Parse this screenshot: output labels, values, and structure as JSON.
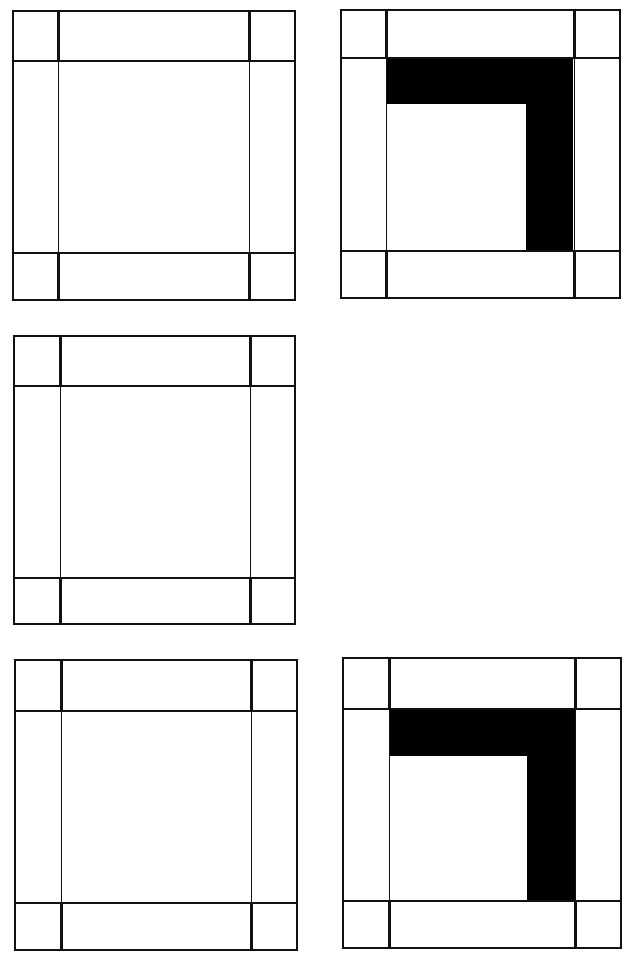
{
  "figure": {
    "colors": {
      "line": "#111111",
      "fill": "#000000",
      "background": "#ffffff"
    },
    "blocks": [
      {
        "id": "top-left",
        "x": 12,
        "y": 10,
        "w": 284,
        "h": 291,
        "v": [
          58,
          249
        ],
        "h_lines": [
          60,
          252
        ],
        "l_shape": false
      },
      {
        "id": "top-right",
        "x": 340,
        "y": 9,
        "w": 281,
        "h": 290,
        "v": [
          386,
          574
        ],
        "h_lines": [
          57,
          250
        ],
        "l_shape": true,
        "l_top": [
          387,
          58,
          573,
          104
        ],
        "l_right": [
          526,
          58,
          573,
          250
        ]
      },
      {
        "id": "middle-left",
        "x": 13,
        "y": 335,
        "w": 283,
        "h": 290,
        "v": [
          60,
          250
        ],
        "h_lines": [
          385,
          577
        ],
        "l_shape": false
      },
      {
        "id": "bottom-left",
        "x": 14,
        "y": 659,
        "w": 284,
        "h": 292,
        "v": [
          61,
          251
        ],
        "h_lines": [
          710,
          902
        ],
        "l_shape": false
      },
      {
        "id": "bottom-right",
        "x": 342,
        "y": 657,
        "w": 280,
        "h": 292,
        "v": [
          389,
          575
        ],
        "h_lines": [
          708,
          900
        ],
        "l_shape": true,
        "l_top": [
          389,
          708,
          575,
          756
        ],
        "l_right": [
          527,
          708,
          575,
          900
        ]
      }
    ]
  }
}
